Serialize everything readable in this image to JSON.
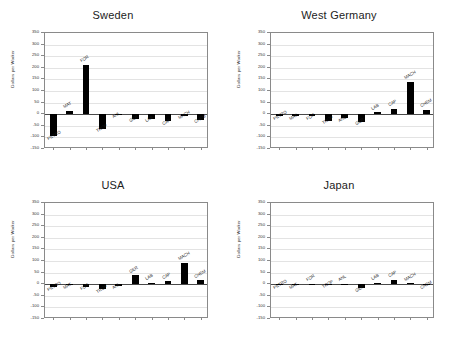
{
  "figure": {
    "background": "#ffffff",
    "bar_color": "#000000",
    "grid_color": "#e3e3e3",
    "axis_color": "#8a8a8a",
    "layout": "2x2 grid of bar charts"
  },
  "axis": {
    "ylabel": "Dollars per Worker",
    "yticks": [
      350,
      300,
      250,
      200,
      150,
      100,
      50,
      0,
      -50,
      -100,
      -150
    ],
    "ymin": -150,
    "ymax": 350,
    "grid": true,
    "legend": "none"
  },
  "chart_data": [
    {
      "type": "bar",
      "title": "Sweden",
      "xlabel": "",
      "ylabel": "Dollars per Worker",
      "ylim": [
        -150,
        350
      ],
      "categories": [
        "PETRO",
        "MAT",
        "FOR",
        "TROP",
        "ANL",
        "GER",
        "LAB",
        "CAP",
        "MACH",
        "CHEM"
      ],
      "values": [
        -95,
        15,
        212,
        -62,
        -3,
        -20,
        -20,
        -30,
        -6,
        -23
      ]
    },
    {
      "type": "bar",
      "title": "West Germany",
      "xlabel": "",
      "ylabel": "Dollars per Worker",
      "ylim": [
        -150,
        350
      ],
      "categories": [
        "PETRO",
        "MAT",
        "FOR",
        "TROP",
        "ANL",
        "GER",
        "LAB",
        "CAP",
        "MACH",
        "CHEM"
      ],
      "values": [
        -8,
        -8,
        -8,
        -28,
        -18,
        -32,
        8,
        22,
        140,
        20
      ]
    },
    {
      "type": "bar",
      "title": "USA",
      "xlabel": "",
      "ylabel": "Dollars per Worker",
      "ylim": [
        -150,
        350
      ],
      "categories": [
        "PETRO",
        "MAT",
        "FOR",
        "TROP",
        "ANL",
        "GER",
        "LAB",
        "CAP",
        "MACH",
        "CHEM"
      ],
      "values": [
        -12,
        -5,
        -10,
        -22,
        -6,
        38,
        7,
        13,
        92,
        17
      ]
    },
    {
      "type": "bar",
      "title": "Japan",
      "xlabel": "",
      "ylabel": "Dollars per Worker",
      "ylim": [
        -150,
        350
      ],
      "categories": [
        "PETRO",
        "MAT",
        "FOR",
        "TROP",
        "ANL",
        "GER",
        "LAB",
        "CAP",
        "MACH",
        "CHEM"
      ],
      "values": [
        -5,
        -5,
        3,
        -3,
        3,
        -18,
        6,
        18,
        4,
        -4
      ]
    }
  ]
}
